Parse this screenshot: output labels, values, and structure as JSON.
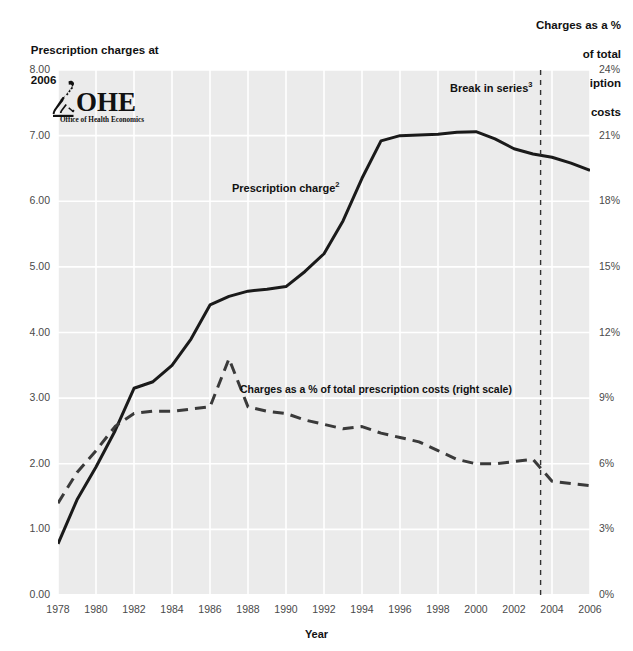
{
  "titles": {
    "left_axis_line1": "Prescription charges at",
    "left_axis_line2_pre": "2006 prices",
    "left_axis_line2_sup": "1",
    "left_axis_line2_post": " (£)",
    "right_axis_line1": "Charges as a %",
    "right_axis_line2": "of total",
    "right_axis_line3": "prescription",
    "right_axis_line4": "costs",
    "x_axis": "Year"
  },
  "logo": {
    "mark": "microscope-icon",
    "wordmark": "OHE",
    "tagline": "Office of Health Economics"
  },
  "annotations": {
    "series_charge_pre": "Prescription charge",
    "series_charge_sup": "2",
    "break_pre": "Break in series",
    "break_sup": "3",
    "series_pct": "Charges as a % of total prescription costs (right scale)"
  },
  "chart_data": {
    "type": "line",
    "title": "",
    "xlabel": "Year",
    "ylabel": "Prescription charges at 2006 prices (£)",
    "y2label": "Charges as a % of total prescription costs",
    "xlim": [
      1978,
      2006
    ],
    "ylim": [
      0,
      8
    ],
    "y2lim": [
      0,
      24
    ],
    "yticks": [
      "0.00",
      "1.00",
      "2.00",
      "3.00",
      "4.00",
      "5.00",
      "6.00",
      "7.00",
      "8.00"
    ],
    "ytick_values": [
      0,
      1,
      2,
      3,
      4,
      5,
      6,
      7,
      8
    ],
    "y2ticks": [
      "0%",
      "3%",
      "6%",
      "9%",
      "12%",
      "15%",
      "18%",
      "21%",
      "24%"
    ],
    "y2tick_values": [
      0,
      3,
      6,
      9,
      12,
      15,
      18,
      21,
      24
    ],
    "xticks": [
      1978,
      1980,
      1982,
      1984,
      1986,
      1988,
      1990,
      1992,
      1994,
      1996,
      1998,
      2000,
      2002,
      2004,
      2006
    ],
    "grid": true,
    "legend_position": "inline-annotations",
    "x": [
      1978,
      1979,
      1980,
      1981,
      1982,
      1983,
      1984,
      1985,
      1986,
      1987,
      1988,
      1989,
      1990,
      1991,
      1992,
      1993,
      1994,
      1995,
      1996,
      1997,
      1998,
      1999,
      2000,
      2001,
      2002,
      2003,
      2004,
      2005,
      2006
    ],
    "series": [
      {
        "name": "Prescription charge",
        "axis": "left",
        "style": "solid",
        "color": "#1a1a1a",
        "values": [
          0.78,
          1.45,
          1.95,
          2.5,
          3.15,
          3.25,
          3.5,
          3.9,
          4.42,
          4.55,
          4.63,
          4.66,
          4.7,
          4.93,
          5.2,
          5.7,
          6.35,
          6.92,
          7.0,
          7.01,
          7.02,
          7.05,
          7.06,
          6.95,
          6.8,
          6.72,
          6.67,
          6.58,
          6.47
        ]
      },
      {
        "name": "Charges as a % of total prescription costs",
        "axis": "right",
        "style": "dashed",
        "color": "#3a3a3a",
        "values": [
          4.2,
          5.6,
          6.6,
          7.7,
          8.3,
          8.4,
          8.4,
          8.5,
          8.6,
          10.8,
          8.6,
          8.4,
          8.3,
          8.0,
          7.8,
          7.6,
          7.7,
          7.4,
          7.2,
          7.0,
          6.6,
          6.2,
          6.0,
          6.0,
          6.1,
          6.2,
          5.2,
          5.1,
          5.0
        ],
        "break_note": "Break in series at 2003"
      }
    ],
    "vertical_markers": [
      {
        "name": "break-in-series",
        "x": 2003.4,
        "style": "dashed",
        "label": "Break in series"
      }
    ]
  }
}
